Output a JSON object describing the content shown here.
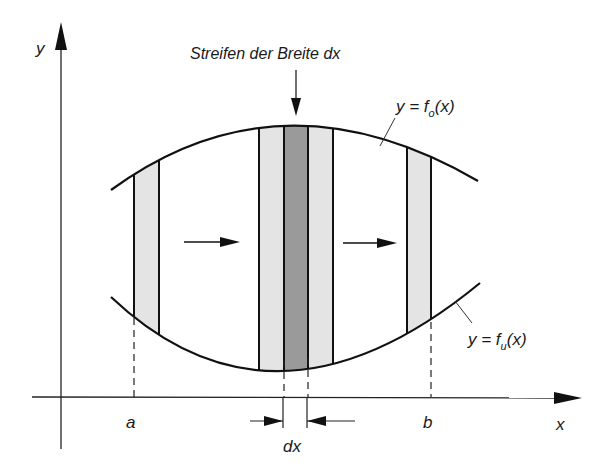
{
  "diagram": {
    "type": "integration-strip-diagram",
    "title_label": "Streifen der Breite dx",
    "axes": {
      "x_label": "x",
      "y_label": "y"
    },
    "curves": {
      "upper": {
        "prefix": "y = f",
        "subscript": "o",
        "suffix": "(x)"
      },
      "lower": {
        "prefix": "y = f",
        "subscript": "u",
        "suffix": "(x)"
      }
    },
    "bounds": {
      "a_label": "a",
      "b_label": "b"
    },
    "width_label": "dx",
    "strips": [
      {
        "name": "strip-at-a",
        "x1": 134,
        "x2": 159,
        "fill": "light"
      },
      {
        "name": "strip-left-of-center",
        "x1": 259,
        "x2": 284,
        "fill": "light"
      },
      {
        "name": "strip-center-highlighted",
        "x1": 284,
        "x2": 308,
        "fill": "dark"
      },
      {
        "name": "strip-right-of-center",
        "x1": 308,
        "x2": 333,
        "fill": "light"
      },
      {
        "name": "strip-at-b",
        "x1": 407,
        "x2": 431,
        "fill": "light"
      }
    ],
    "colors": {
      "line": "#111111",
      "strip_light": "#e4e4e4",
      "strip_dark": "#9a9a9a",
      "background": "#ffffff"
    }
  }
}
